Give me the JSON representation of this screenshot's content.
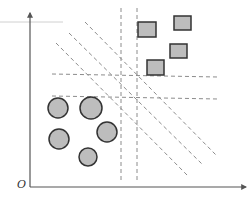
{
  "diagram": {
    "title": "",
    "type": "linear separability / separating hyperplanes",
    "origin_label": "O",
    "colors": {
      "axis": "#555555",
      "dashed": "#8c8c8c",
      "shape_fill": "#bdbdbd",
      "shape_stroke": "#333333",
      "faint_line": "#d0d0d0"
    },
    "axes": {
      "origin": [
        30,
        187
      ],
      "y_axis_top": [
        30,
        13
      ],
      "x_axis_right": [
        246,
        187
      ]
    },
    "faint_line": {
      "x1": 0,
      "y1": 22,
      "x2": 63,
      "y2": 22
    },
    "classes": [
      {
        "name": "circles",
        "shape": "circle",
        "points": [
          {
            "cx": 58,
            "cy": 108,
            "r": 10
          },
          {
            "cx": 91,
            "cy": 108,
            "r": 11
          },
          {
            "cx": 59,
            "cy": 139,
            "r": 10
          },
          {
            "cx": 107,
            "cy": 132,
            "r": 10
          },
          {
            "cx": 88,
            "cy": 157,
            "r": 9
          }
        ]
      },
      {
        "name": "squares",
        "shape": "square",
        "points": [
          {
            "x": 138,
            "y": 22,
            "w": 18,
            "h": 15
          },
          {
            "x": 174,
            "y": 16,
            "w": 17,
            "h": 14
          },
          {
            "x": 170,
            "y": 44,
            "w": 17,
            "h": 14
          },
          {
            "x": 147,
            "y": 60,
            "w": 17,
            "h": 15
          }
        ]
      }
    ],
    "separating_lines": [
      {
        "orientation": "vertical",
        "x1": 121,
        "y1": 8,
        "x2": 121,
        "y2": 180
      },
      {
        "orientation": "vertical",
        "x1": 137,
        "y1": 8,
        "x2": 137,
        "y2": 180
      },
      {
        "orientation": "horizontal",
        "x1": 52,
        "y1": 74,
        "x2": 218,
        "y2": 77
      },
      {
        "orientation": "horizontal",
        "x1": 52,
        "y1": 96,
        "x2": 218,
        "y2": 99
      },
      {
        "orientation": "diagonal",
        "x1": 56,
        "y1": 43,
        "x2": 188,
        "y2": 176
      },
      {
        "orientation": "diagonal",
        "x1": 69,
        "y1": 33,
        "x2": 203,
        "y2": 165
      },
      {
        "orientation": "diagonal",
        "x1": 85,
        "y1": 22,
        "x2": 216,
        "y2": 155
      }
    ]
  }
}
